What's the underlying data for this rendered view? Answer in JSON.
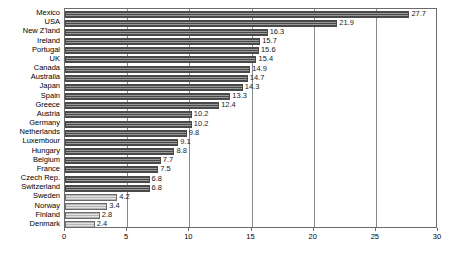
{
  "chart_data": {
    "type": "bar",
    "orientation": "horizontal",
    "title": "",
    "subtitle": "",
    "xlabel": "",
    "ylabel": "",
    "xlim": [
      0,
      30
    ],
    "xticks": [
      0,
      5,
      10,
      15,
      20,
      25,
      30
    ],
    "xtick_labels": [
      "0",
      "5",
      "10",
      "15",
      "20",
      "25",
      "30"
    ],
    "grid": true,
    "grid_axis": "x",
    "legend": false,
    "legend_position": "none",
    "categories": [
      "Mexico",
      "USA",
      "New Z'land",
      "Ireland",
      "Portugal",
      "UK",
      "Canada",
      "Australia",
      "Japan",
      "Spain",
      "Greece",
      "Austria",
      "Germany",
      "Netherlands",
      "Luxembour",
      "Hungary",
      "Belgium",
      "France",
      "Czech Rep.",
      "Switzerland",
      "Sweden",
      "Norway",
      "Finland",
      "Denmark"
    ],
    "values": [
      27.7,
      21.9,
      16.3,
      15.7,
      15.6,
      15.4,
      14.9,
      14.7,
      14.3,
      13.3,
      12.4,
      10.2,
      10.2,
      9.8,
      9.1,
      8.8,
      7.7,
      7.5,
      6.8,
      6.8,
      4.2,
      3.4,
      2.8,
      2.4
    ],
    "value_labels": [
      "27.7",
      "21.9",
      "16.3",
      "15.7",
      "15.6",
      "15.4",
      "14.9",
      "14.7",
      "14.3",
      "13.3",
      "12.4",
      "10.2",
      "10.2",
      "9.8",
      "9.1",
      "8.8",
      "7.7",
      "7.5",
      "6.8",
      "6.8",
      "4.2",
      "3.4",
      "2.8",
      "2.4"
    ],
    "bar_styles": [
      "dark",
      "dark",
      "dark",
      "dark",
      "dark",
      "dark",
      "dark",
      "dark",
      "dark",
      "dark",
      "dark",
      "dark",
      "dark",
      "dark",
      "dark",
      "dark",
      "dark",
      "dark",
      "dark",
      "dark",
      "light",
      "light",
      "light",
      "light"
    ],
    "colors": {
      "bar_dark": "#6e6e6e",
      "bar_light": "#c9c9c9",
      "bar_edge": "#4a4a4a",
      "gridline": "#8a8a8a",
      "axis": "#6b6b6b",
      "text": "#000000",
      "background": "#ffffff"
    }
  }
}
